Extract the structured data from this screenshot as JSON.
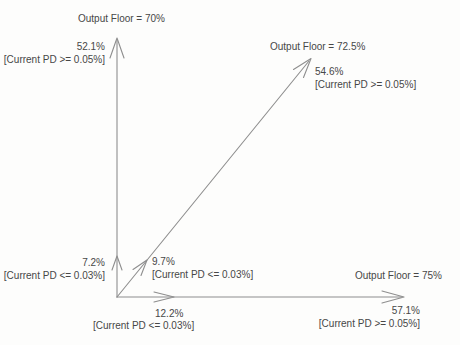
{
  "figure": {
    "colors": {
      "background": "#fdfdfc",
      "line": "#8e8e8e",
      "text": "#474747"
    },
    "vertical_axis": {
      "floor_label": "Output Floor = 70%",
      "end_value": "52.1%",
      "end_condition": "[Current PD >= 0.05%]",
      "mid_value": "7.2%",
      "mid_condition": "[Current PD <= 0.03%]"
    },
    "diagonal_axis": {
      "floor_label": "Output Floor = 72.5%",
      "end_value": "54.6%",
      "end_condition": "[Current PD >= 0.05%]",
      "mid_value": "9.7%",
      "mid_condition": "[Current PD <= 0.03%]"
    },
    "horizontal_axis": {
      "floor_label": "Output Floor = 75%",
      "end_value": "57.1%",
      "end_condition": "[Current PD >= 0.05%]",
      "mid_value": "12.2%",
      "mid_condition": "[Current PD <= 0.03%]"
    }
  }
}
